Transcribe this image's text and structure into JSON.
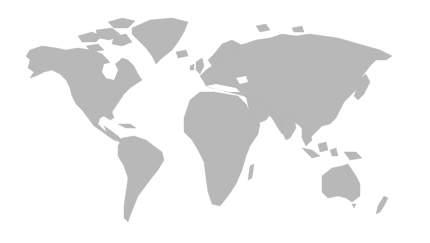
{
  "map": {
    "type": "world-map",
    "style": "grayscale-silhouette",
    "background_color": "#ffffff",
    "land_color": "#b8b8b8",
    "regions": [
      {
        "name": "north-america"
      },
      {
        "name": "greenland"
      },
      {
        "name": "south-america"
      },
      {
        "name": "europe"
      },
      {
        "name": "africa"
      },
      {
        "name": "asia"
      },
      {
        "name": "australia"
      },
      {
        "name": "new-zealand"
      },
      {
        "name": "madagascar"
      },
      {
        "name": "uk-ireland"
      },
      {
        "name": "japan"
      },
      {
        "name": "indonesia"
      },
      {
        "name": "arctic-islands"
      }
    ]
  }
}
